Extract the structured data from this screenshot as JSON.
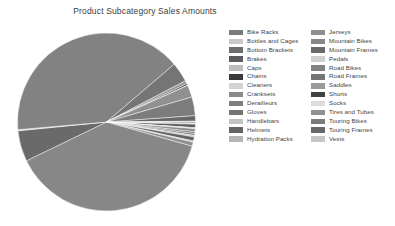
{
  "chart_data": {
    "type": "pie",
    "title": "Product Subcategory Sales Amounts",
    "xlabel": "",
    "ylabel": "",
    "legend_position": "right",
    "grid": false,
    "categories": [
      "Bike Racks",
      "Bottles and Cages",
      "Bottom Brackets",
      "Brakes",
      "Caps",
      "Chains",
      "Cleaners",
      "Cranksets",
      "Derailleurs",
      "Gloves",
      "Handlebars",
      "Helmets",
      "Hydration Packs",
      "Jerseys",
      "Mountain Bikes",
      "Mountain Frames",
      "Pedals",
      "Road Bikes",
      "Road Frames",
      "Saddles",
      "Shorts",
      "Socks",
      "Tires and Tubes",
      "Touring Bikes",
      "Touring Frames",
      "Vests"
    ],
    "values": [
      0.25,
      0.07,
      0.09,
      0.62,
      0.06,
      0.09,
      0.03,
      0.55,
      0.35,
      0.33,
      0.26,
      0.74,
      0.21,
      0.75,
      38.5,
      5.6,
      0.21,
      40.2,
      3.6,
      0.58,
      0.31,
      0.03,
      2.2,
      3.4,
      1.0,
      0.14
    ],
    "value_unit": "percent",
    "colors": [
      "#7a7a7a",
      "#c9c9c9",
      "#6e6e6e",
      "#5c5c5c",
      "#bdbdbd",
      "#3a3a3a",
      "#d4d4d4",
      "#8b8b8b",
      "#7f7f7f",
      "#747474",
      "#c2c2c2",
      "#636363",
      "#b5b5b5",
      "#8f8f8f",
      "#878787",
      "#6a6a6a",
      "#cfcfcf",
      "#828282",
      "#757575",
      "#9a9a9a",
      "#414141",
      "#dcdcdc",
      "#909090",
      "#7c7c7c",
      "#686868",
      "#c6c6c6"
    ],
    "legend_columns": {
      "left": [
        "Bike Racks",
        "Bottles and Cages",
        "Bottom Brackets",
        "Brakes",
        "Caps",
        "Chains",
        "Cleaners",
        "Cranksets",
        "Derailleurs",
        "Gloves",
        "Handlebars",
        "Helmets",
        "Hydration Packs"
      ],
      "right": [
        "Jerseys",
        "Mountain Bikes",
        "Mountain Frames",
        "Pedals",
        "Road Bikes",
        "Road Frames",
        "Saddles",
        "Shorts",
        "Socks",
        "Tires and Tubes",
        "Touring Bikes",
        "Touring Frames",
        "Vests"
      ]
    },
    "geometry": {
      "center_x": 96.5,
      "center_y": 94,
      "radius": 89,
      "start_angle_deg": 0
    },
    "background_color": "#ffffff",
    "title_color": "#3b3b3b",
    "label_color": "#3f3f3f"
  }
}
